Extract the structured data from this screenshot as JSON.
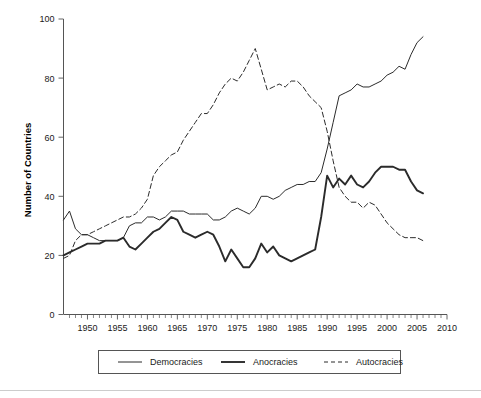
{
  "chart_data": {
    "type": "line",
    "title": "",
    "subtitle": "",
    "xlabel": "",
    "ylabel": "Number of Countries",
    "xlim": [
      1946,
      2010
    ],
    "ylim": [
      0,
      100
    ],
    "grid": false,
    "legend_position": "bottom",
    "x_ticks": [
      1950,
      1955,
      1960,
      1965,
      1970,
      1975,
      1980,
      1985,
      1990,
      1995,
      2000,
      2005,
      2010
    ],
    "x_tick_labels": [
      "1950",
      "1955",
      "1960",
      "1965",
      "1970",
      "1975",
      "1980",
      "1985",
      "1990",
      "1995",
      "2000",
      "2005",
      "2010"
    ],
    "y_ticks": [
      0,
      20,
      40,
      60,
      80,
      100
    ],
    "y_tick_labels": [
      "0",
      "20",
      "40",
      "60",
      "80",
      "100"
    ],
    "x": [
      1946,
      1947,
      1948,
      1949,
      1950,
      1951,
      1952,
      1953,
      1954,
      1955,
      1956,
      1957,
      1958,
      1959,
      1960,
      1961,
      1962,
      1963,
      1964,
      1965,
      1966,
      1967,
      1968,
      1969,
      1970,
      1971,
      1972,
      1973,
      1974,
      1975,
      1976,
      1977,
      1978,
      1979,
      1980,
      1981,
      1982,
      1983,
      1984,
      1985,
      1986,
      1987,
      1988,
      1989,
      1990,
      1991,
      1992,
      1993,
      1994,
      1995,
      1996,
      1997,
      1998,
      1999,
      2000,
      2001,
      2002,
      2003,
      2004,
      2005,
      2006
    ],
    "series": [
      {
        "name": "Democracies",
        "style": "solid-thin",
        "color": "#2b2b2b",
        "values": [
          32,
          35,
          29,
          27,
          27,
          26,
          25,
          25,
          25,
          25,
          26,
          30,
          31,
          31,
          33,
          33,
          32,
          33,
          35,
          35,
          35,
          34,
          34,
          34,
          34,
          32,
          32,
          33,
          35,
          36,
          35,
          34,
          36,
          40,
          40,
          39,
          40,
          42,
          43,
          44,
          44,
          45,
          45,
          48,
          56,
          65,
          74,
          75,
          76,
          78,
          77,
          77,
          78,
          79,
          81,
          82,
          84,
          83,
          88,
          92,
          94
        ]
      },
      {
        "name": "Anocracies",
        "style": "solid-thick",
        "color": "#2b2b2b",
        "values": [
          20,
          21,
          22,
          23,
          24,
          24,
          24,
          25,
          25,
          25,
          26,
          23,
          22,
          24,
          26,
          28,
          29,
          31,
          33,
          32,
          28,
          27,
          26,
          27,
          28,
          27,
          23,
          18,
          22,
          19,
          16,
          16,
          19,
          24,
          21,
          23,
          20,
          19,
          18,
          19,
          20,
          21,
          22,
          33,
          47,
          43,
          46,
          44,
          47,
          44,
          43,
          45,
          48,
          50,
          50,
          50,
          49,
          49,
          45,
          42,
          41
        ]
      },
      {
        "name": "Autocracies",
        "style": "dashed",
        "color": "#2b2b2b",
        "values": [
          19,
          20,
          25,
          27,
          27,
          28,
          29,
          30,
          31,
          32,
          33,
          33,
          34,
          36,
          39,
          47,
          50,
          52,
          54,
          55,
          59,
          62,
          65,
          68,
          68,
          71,
          75,
          78,
          80,
          79,
          82,
          86,
          90,
          83,
          76,
          77,
          78,
          77,
          79,
          79,
          77,
          74,
          72,
          70,
          62,
          52,
          43,
          40,
          38,
          38,
          36,
          38,
          37,
          34,
          31,
          29,
          27,
          26,
          26,
          26,
          25
        ]
      }
    ]
  },
  "axis": {
    "y_title": "Number of Countries"
  },
  "legend": {
    "items": [
      {
        "label": "Democracies",
        "style": "solid-thin"
      },
      {
        "label": "Anocracies",
        "style": "solid-thick"
      },
      {
        "label": "Autocracies",
        "style": "dashed"
      }
    ]
  }
}
